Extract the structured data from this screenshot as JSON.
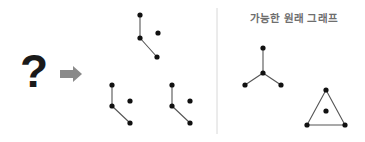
{
  "canvas": {
    "width": 365,
    "height": 142,
    "background": "#ffffff"
  },
  "style": {
    "node_color": "#111111",
    "node_radius": 2.6,
    "edge_color": "#555555",
    "edge_width": 1.1,
    "arrow_color": "#8a8a8a",
    "divider_color": "#d8d8d8",
    "question_color": "#1a1a1a",
    "title_color": "#6e6e6e"
  },
  "left_panel": {
    "question_mark": "?",
    "arrow": "arrow-right-icon",
    "observed_fragments": [
      {
        "name": "fragment-top",
        "nodes": [
          {
            "id": "t1",
            "x": 140,
            "y": 15
          },
          {
            "id": "t2",
            "x": 140,
            "y": 38
          },
          {
            "id": "t3",
            "x": 158,
            "y": 33
          },
          {
            "id": "t4",
            "x": 157,
            "y": 57
          }
        ],
        "edges": [
          {
            "from": "t1",
            "to": "t2"
          },
          {
            "from": "t2",
            "to": "t4"
          }
        ]
      },
      {
        "name": "fragment-bottom-left",
        "nodes": [
          {
            "id": "l1",
            "x": 112,
            "y": 85
          },
          {
            "id": "l2",
            "x": 112,
            "y": 106
          },
          {
            "id": "l3",
            "x": 130,
            "y": 101
          },
          {
            "id": "l4",
            "x": 130,
            "y": 123
          }
        ],
        "edges": [
          {
            "from": "l1",
            "to": "l2"
          },
          {
            "from": "l2",
            "to": "l4"
          }
        ]
      },
      {
        "name": "fragment-bottom-right",
        "nodes": [
          {
            "id": "r1",
            "x": 172,
            "y": 85
          },
          {
            "id": "r2",
            "x": 172,
            "y": 106
          },
          {
            "id": "r3",
            "x": 190,
            "y": 101
          },
          {
            "id": "r4",
            "x": 190,
            "y": 123
          }
        ],
        "edges": [
          {
            "from": "r1",
            "to": "r2"
          },
          {
            "from": "r2",
            "to": "r4"
          }
        ]
      }
    ]
  },
  "divider": {
    "x": 217,
    "y1": 8,
    "y2": 134
  },
  "right_panel": {
    "title": "가능한 원래 그래프",
    "candidate_graphs": [
      {
        "name": "star-graph",
        "nodes": [
          {
            "id": "s_top",
            "x": 263,
            "y": 48
          },
          {
            "id": "s_center",
            "x": 263,
            "y": 73
          },
          {
            "id": "s_left",
            "x": 245,
            "y": 85
          },
          {
            "id": "s_right",
            "x": 281,
            "y": 85
          }
        ],
        "edges": [
          {
            "from": "s_center",
            "to": "s_top"
          },
          {
            "from": "s_center",
            "to": "s_left"
          },
          {
            "from": "s_center",
            "to": "s_right"
          }
        ]
      },
      {
        "name": "triangle-graph",
        "nodes": [
          {
            "id": "g_apex",
            "x": 326,
            "y": 90
          },
          {
            "id": "g_bl",
            "x": 307,
            "y": 125
          },
          {
            "id": "g_br",
            "x": 345,
            "y": 125
          },
          {
            "id": "g_center",
            "x": 326,
            "y": 111
          }
        ],
        "edges": [
          {
            "from": "g_apex",
            "to": "g_bl"
          },
          {
            "from": "g_apex",
            "to": "g_br"
          },
          {
            "from": "g_bl",
            "to": "g_br"
          }
        ]
      }
    ]
  }
}
